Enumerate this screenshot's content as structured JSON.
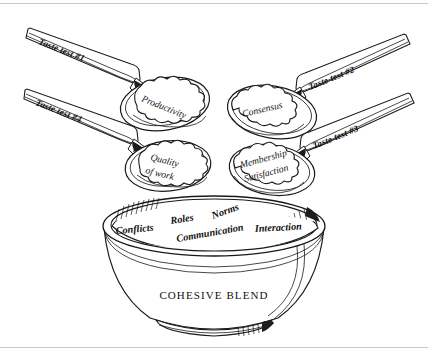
{
  "figure": {
    "title_text": "COHESIVE BLEND",
    "background_color": "#ffffff",
    "ink_color": "#1a1a1a",
    "border_rule_color": "#c9c9c9"
  },
  "spoons": [
    {
      "id": "spoon-top-left",
      "handle_label": "Taste test #1",
      "scoop_label_line1": "Productivity",
      "scoop_label_line2": "",
      "position": "top-left"
    },
    {
      "id": "spoon-top-right",
      "handle_label": "Taste test #2",
      "scoop_label_line1": "Consensus",
      "scoop_label_line2": "",
      "position": "top-right"
    },
    {
      "id": "spoon-bottom-right",
      "handle_label": "Taste test #3",
      "scoop_label_line1": "Membership",
      "scoop_label_line2": "Satisfaction",
      "position": "bottom-right"
    },
    {
      "id": "spoon-bottom-left",
      "handle_label": "Taste test #4",
      "scoop_label_line1": "Quality",
      "scoop_label_line2": "of work",
      "position": "bottom-left"
    }
  ],
  "bowl": {
    "base_label": "COHESIVE BLEND",
    "mixture_words": [
      {
        "text": "Roles",
        "slot": "upper-center-left"
      },
      {
        "text": "Norms",
        "slot": "upper-center-right"
      },
      {
        "text": "Conflicts",
        "slot": "lower-left"
      },
      {
        "text": "Communication",
        "slot": "lower-center"
      },
      {
        "text": "Interaction",
        "slot": "lower-right"
      }
    ]
  }
}
